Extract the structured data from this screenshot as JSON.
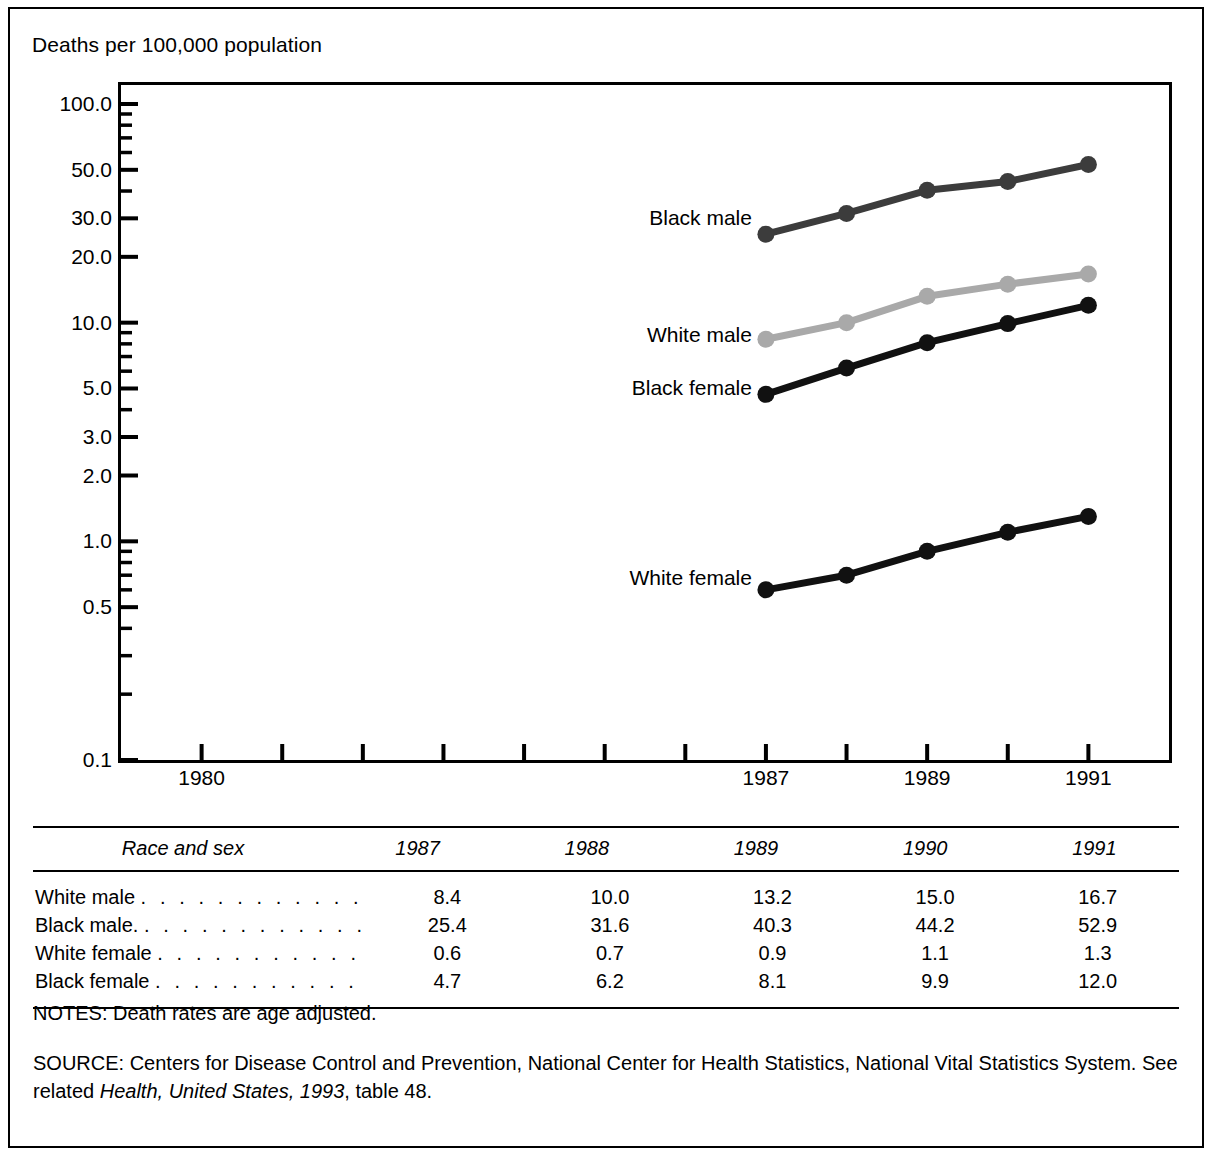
{
  "figure": {
    "y_axis_title": "Deaths per 100,000 population"
  },
  "chart_data": {
    "type": "line",
    "title": "",
    "xlabel": "",
    "ylabel": "Deaths per 100,000 population",
    "yscale": "log",
    "ylim": [
      0.1,
      100.0
    ],
    "xlim": [
      1979,
      1992
    ],
    "grid": false,
    "legend": "inline-labels",
    "ytick_labels": [
      "100.0",
      "50.0",
      "30.0",
      "20.0",
      "10.0",
      "5.0",
      "3.0",
      "2.0",
      "1.0",
      "0.5",
      "0.1"
    ],
    "ytick_values": [
      100.0,
      50.0,
      30.0,
      20.0,
      10.0,
      5.0,
      3.0,
      2.0,
      1.0,
      0.5,
      0.1
    ],
    "xtick_values": [
      1980,
      1981,
      1982,
      1983,
      1984,
      1985,
      1986,
      1987,
      1988,
      1989,
      1990,
      1991
    ],
    "xtick_labels": [
      "1980",
      "",
      "",
      "",
      "",
      "",
      "",
      "1987",
      "",
      "1989",
      "",
      "1991"
    ],
    "x": [
      1987,
      1988,
      1989,
      1990,
      1991
    ],
    "series": [
      {
        "name": "Black male",
        "values": [
          25.4,
          31.6,
          40.3,
          44.2,
          52.9
        ],
        "color": "#3c3c3c"
      },
      {
        "name": "White male",
        "values": [
          8.4,
          10.0,
          13.2,
          15.0,
          16.7
        ],
        "color": "#a9a9a9"
      },
      {
        "name": "Black female",
        "values": [
          4.7,
          6.2,
          8.1,
          9.9,
          12.0
        ],
        "color": "#111111"
      },
      {
        "name": "White female",
        "values": [
          0.6,
          0.7,
          0.9,
          1.1,
          1.3
        ],
        "color": "#111111"
      }
    ],
    "inline_labels": [
      {
        "text": "Black male",
        "at_x": 1987,
        "at_y": 30.0
      },
      {
        "text": "White male",
        "at_x": 1987,
        "at_y": 8.8
      },
      {
        "text": "Black female",
        "at_x": 1987,
        "at_y": 5.0
      },
      {
        "text": "White female",
        "at_x": 1987,
        "at_y": 0.68
      }
    ]
  },
  "table": {
    "headers": [
      "Race and sex",
      "1987",
      "1988",
      "1989",
      "1990",
      "1991"
    ],
    "rows": [
      {
        "label": "White male",
        "leader": ". . . . . . . . . . . .",
        "values": [
          "8.4",
          "10.0",
          "13.2",
          "15.0",
          "16.7"
        ]
      },
      {
        "label": "Black male.",
        "leader": ". . . . . . . . . . . .",
        "values": [
          "25.4",
          "31.6",
          "40.3",
          "44.2",
          "52.9"
        ]
      },
      {
        "label": "White female",
        "leader": ". . . . . . . . . . .",
        "values": [
          "0.6",
          "0.7",
          "0.9",
          "1.1",
          "1.3"
        ]
      },
      {
        "label": "Black female",
        "leader": ". . . . . . . . . . .",
        "values": [
          "4.7",
          "6.2",
          "8.1",
          "9.9",
          "12.0"
        ]
      }
    ]
  },
  "notes": {
    "text": "NOTES: Death rates are age adjusted."
  },
  "source": {
    "prefix": "SOURCE: Centers for Disease Control and Prevention, National Center for Health Statistics, National Vital Statistics System. See related ",
    "italic": "Health, United States, 1993",
    "suffix": ", table 48."
  }
}
